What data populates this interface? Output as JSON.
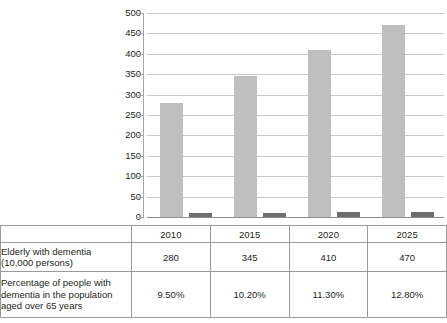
{
  "chart_data": {
    "type": "bar",
    "title": "",
    "xlabel": "",
    "ylabel": "",
    "categories": [
      "2010",
      "2015",
      "2020",
      "2025"
    ],
    "ylim": [
      0,
      500
    ],
    "ytick_labels": [
      "0",
      "50",
      "100",
      "150",
      "200",
      "250",
      "300",
      "350",
      "400",
      "450",
      "500"
    ],
    "ytick_values": [
      0,
      50,
      100,
      150,
      200,
      250,
      300,
      350,
      400,
      450,
      500
    ],
    "grid": true,
    "legend": "none",
    "series": [
      {
        "name": "Elderly with dementia (10,000 persons)",
        "values": [
          280,
          345,
          410,
          470
        ],
        "color": "#bfbfbf"
      },
      {
        "name": "Percentage of people with dementia in the population aged over 65 years",
        "values": [
          9.5,
          10.2,
          11.3,
          12.8
        ],
        "color": "#6d6d6d"
      }
    ]
  },
  "table": {
    "year_header": [
      "2010",
      "2015",
      "2020",
      "2025"
    ],
    "rows": [
      {
        "label": "Elderly with dementia\n(10,000 persons)",
        "label_line1": "Elderly with dementia",
        "label_line2": "(10,000 persons)",
        "values": [
          "280",
          "345",
          "410",
          "470"
        ]
      },
      {
        "label": "Percentage of people with dementia in the population aged over 65 years",
        "label_line1": "Percentage of people with",
        "label_line2": "dementia in the population",
        "label_line3": "aged over 65 years",
        "values": [
          "9.50%",
          "10.20%",
          "11.30%",
          "12.80%"
        ]
      }
    ]
  },
  "colors": {
    "bar_primary": "#bfbfbf",
    "bar_secondary": "#6d6d6d",
    "gridline": "#c9c9c9",
    "axis": "#a6a6a6",
    "border": "#9a9a9a",
    "text": "#231f20"
  }
}
